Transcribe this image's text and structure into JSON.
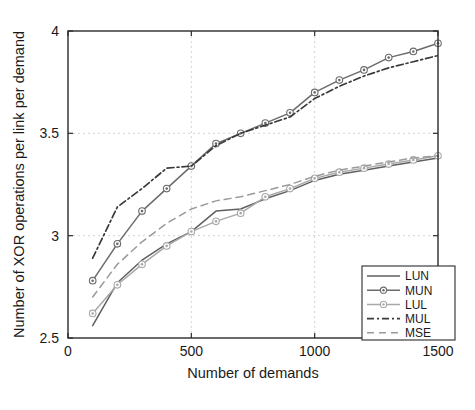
{
  "chart_data": {
    "type": "line",
    "title": "",
    "xlabel": "Number of demands",
    "ylabel": "Number of XOR operations per link per demand",
    "xlim": [
      0,
      1500
    ],
    "ylim": [
      2.5,
      4.0
    ],
    "xticks": [
      0,
      500,
      1000,
      1500
    ],
    "xtick_labels": [
      "0",
      "500",
      "1000",
      "1500"
    ],
    "yticks": [
      2.5,
      3.0,
      3.5,
      4.0
    ],
    "ytick_labels": [
      "2.5",
      "3",
      "3.5",
      "4"
    ],
    "grid": true,
    "legend_position": "lower right",
    "x": [
      100,
      200,
      300,
      400,
      500,
      600,
      700,
      800,
      900,
      1000,
      1100,
      1200,
      1300,
      1400,
      1500
    ],
    "series": [
      {
        "name": "LUN",
        "style": "solid",
        "marker": "none",
        "color": "#5f5f5f",
        "values": [
          2.56,
          2.77,
          2.88,
          2.96,
          3.02,
          3.12,
          3.13,
          3.18,
          3.22,
          3.27,
          3.3,
          3.32,
          3.34,
          3.36,
          3.38
        ]
      },
      {
        "name": "MUN",
        "style": "solid",
        "marker": "circle",
        "color": "#6b6b6b",
        "values": [
          2.78,
          2.96,
          3.12,
          3.23,
          3.34,
          3.45,
          3.5,
          3.55,
          3.6,
          3.7,
          3.76,
          3.81,
          3.87,
          3.9,
          3.94
        ]
      },
      {
        "name": "LUL",
        "style": "solid",
        "marker": "circle",
        "color": "#a8a8a8",
        "values": [
          2.62,
          2.76,
          2.86,
          2.95,
          3.02,
          3.07,
          3.11,
          3.19,
          3.23,
          3.28,
          3.31,
          3.33,
          3.35,
          3.37,
          3.39
        ]
      },
      {
        "name": "MUL",
        "style": "dashdot",
        "marker": "none",
        "color": "#3a3a3a",
        "values": [
          2.89,
          3.14,
          3.23,
          3.33,
          3.34,
          3.44,
          3.5,
          3.54,
          3.58,
          3.67,
          3.73,
          3.78,
          3.82,
          3.85,
          3.88
        ]
      },
      {
        "name": "MSE",
        "style": "dashed",
        "marker": "none",
        "color": "#9a9a9a",
        "values": [
          2.7,
          2.86,
          2.97,
          3.06,
          3.13,
          3.17,
          3.19,
          3.22,
          3.25,
          3.29,
          3.32,
          3.34,
          3.36,
          3.38,
          3.39
        ]
      }
    ],
    "legend_entries": [
      {
        "label": "LUN"
      },
      {
        "label": "MUN"
      },
      {
        "label": "LUL"
      },
      {
        "label": "MUL"
      },
      {
        "label": "MSE"
      }
    ]
  }
}
